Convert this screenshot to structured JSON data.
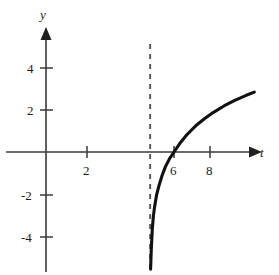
{
  "chart_data": {
    "type": "line",
    "title": "",
    "subtitle": "",
    "xlabel": "t",
    "ylabel": "y",
    "xlim": [
      -1.0,
      11.5
    ],
    "ylim": [
      -5.8,
      5.8
    ],
    "grid": false,
    "legend": null,
    "x_ticks": [
      2,
      6,
      8
    ],
    "x_tick_labels": [
      "2",
      "6",
      "8"
    ],
    "y_ticks": [
      4,
      2,
      -2,
      -4
    ],
    "y_tick_labels": [
      "4",
      "2",
      "-2",
      "-4"
    ],
    "annotations": [
      {
        "name": "vertical-asymptote",
        "style": "dashed",
        "x": 4.8,
        "label": ""
      }
    ],
    "series": [
      {
        "name": "logarithmic-curve",
        "color": "#111111",
        "x_intercept": 5.9,
        "asymptote_x": 4.8,
        "x": [
          4.82,
          4.85,
          4.9,
          4.95,
          5.0,
          5.1,
          5.2,
          5.35,
          5.5,
          5.7,
          5.9,
          6.2,
          6.5,
          6.9,
          7.3,
          7.7,
          8.2,
          8.7,
          9.2,
          9.6
        ],
        "y": [
          -5.5,
          -4.6,
          -3.6,
          -3.0,
          -2.6,
          -2.0,
          -1.6,
          -1.1,
          -0.7,
          -0.3,
          0.0,
          0.45,
          0.82,
          1.23,
          1.56,
          1.85,
          2.16,
          2.42,
          2.65,
          2.81
        ]
      }
    ]
  },
  "axes": {
    "x_axis_name": "t",
    "y_axis_name": "y"
  },
  "colors": {
    "axis": "#3a3a3a",
    "curve": "#111111",
    "asymptote": "#555555",
    "text": "#1a1a1a",
    "background": "#ffffff"
  }
}
